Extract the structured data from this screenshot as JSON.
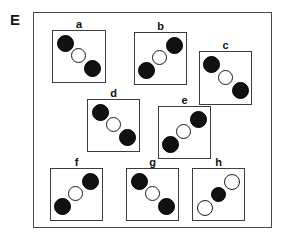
{
  "figure": {
    "panel_letter": "E",
    "width": 286,
    "height": 238,
    "background_color": "#ffffff",
    "frame_color": "#4a4a4a",
    "box_color": "#3c3c3c",
    "filled_circle_color": "#111111",
    "open_circle_color": "#ffffff",
    "open_circle_border_color": "#1a1a1a"
  },
  "panels": [
    {
      "label": "a",
      "box": {
        "left": 52,
        "top": 30,
        "width": 54,
        "height": 53
      },
      "circles": [
        {
          "fill": "filled",
          "left": 4,
          "top": 4,
          "size": 17,
          "role": "top-left-filled"
        },
        {
          "fill": "open",
          "left": 18,
          "top": 17,
          "size": 15,
          "role": "center-open"
        },
        {
          "fill": "filled",
          "left": 31,
          "top": 29,
          "size": 17,
          "role": "bottom-right-filled"
        }
      ]
    },
    {
      "label": "b",
      "box": {
        "left": 134,
        "top": 32,
        "width": 53,
        "height": 53
      },
      "circles": [
        {
          "fill": "filled",
          "left": 31,
          "top": 4,
          "size": 17,
          "role": "top-right-filled"
        },
        {
          "fill": "open",
          "left": 17,
          "top": 17,
          "size": 15,
          "role": "center-open"
        },
        {
          "fill": "filled",
          "left": 3,
          "top": 29,
          "size": 17,
          "role": "bottom-left-filled"
        }
      ]
    },
    {
      "label": "c",
      "box": {
        "left": 199,
        "top": 51,
        "width": 53,
        "height": 54
      },
      "circles": [
        {
          "fill": "filled",
          "left": 3,
          "top": 4,
          "size": 17,
          "role": "top-left-filled"
        },
        {
          "fill": "open",
          "left": 18,
          "top": 18,
          "size": 15,
          "role": "center-open"
        },
        {
          "fill": "filled",
          "left": 32,
          "top": 30,
          "size": 17,
          "role": "bottom-right-filled"
        }
      ]
    },
    {
      "label": "d",
      "box": {
        "left": 87,
        "top": 99,
        "width": 53,
        "height": 53
      },
      "circles": [
        {
          "fill": "filled",
          "left": 4,
          "top": 4,
          "size": 17,
          "role": "top-left-filled"
        },
        {
          "fill": "open",
          "left": 18,
          "top": 17,
          "size": 15,
          "role": "center-open"
        },
        {
          "fill": "filled",
          "left": 31,
          "top": 29,
          "size": 17,
          "role": "bottom-right-filled"
        }
      ]
    },
    {
      "label": "e",
      "box": {
        "left": 158,
        "top": 106,
        "width": 53,
        "height": 53
      },
      "circles": [
        {
          "fill": "filled",
          "left": 31,
          "top": 4,
          "size": 17,
          "role": "top-right-filled"
        },
        {
          "fill": "open",
          "left": 17,
          "top": 17,
          "size": 15,
          "role": "center-open"
        },
        {
          "fill": "filled",
          "left": 3,
          "top": 29,
          "size": 17,
          "role": "bottom-left-filled"
        }
      ]
    },
    {
      "label": "f",
      "box": {
        "left": 50,
        "top": 168,
        "width": 53,
        "height": 53
      },
      "circles": [
        {
          "fill": "filled",
          "left": 31,
          "top": 4,
          "size": 17,
          "role": "top-right-filled"
        },
        {
          "fill": "open",
          "left": 17,
          "top": 17,
          "size": 15,
          "role": "center-open"
        },
        {
          "fill": "filled",
          "left": 3,
          "top": 29,
          "size": 17,
          "role": "bottom-left-filled"
        }
      ]
    },
    {
      "label": "g",
      "box": {
        "left": 126,
        "top": 168,
        "width": 53,
        "height": 53
      },
      "circles": [
        {
          "fill": "filled",
          "left": 4,
          "top": 4,
          "size": 17,
          "role": "top-left-filled"
        },
        {
          "fill": "open",
          "left": 18,
          "top": 17,
          "size": 15,
          "role": "center-open"
        },
        {
          "fill": "filled",
          "left": 31,
          "top": 29,
          "size": 17,
          "role": "bottom-right-filled"
        }
      ]
    },
    {
      "label": "h",
      "box": {
        "left": 192,
        "top": 168,
        "width": 53,
        "height": 53
      },
      "circles": [
        {
          "fill": "open",
          "left": 31,
          "top": 5,
          "size": 16,
          "role": "top-right-open"
        },
        {
          "fill": "filled",
          "left": 18,
          "top": 18,
          "size": 15,
          "role": "center-filled"
        },
        {
          "fill": "open",
          "left": 4,
          "top": 31,
          "size": 16,
          "role": "bottom-left-open"
        }
      ]
    }
  ]
}
